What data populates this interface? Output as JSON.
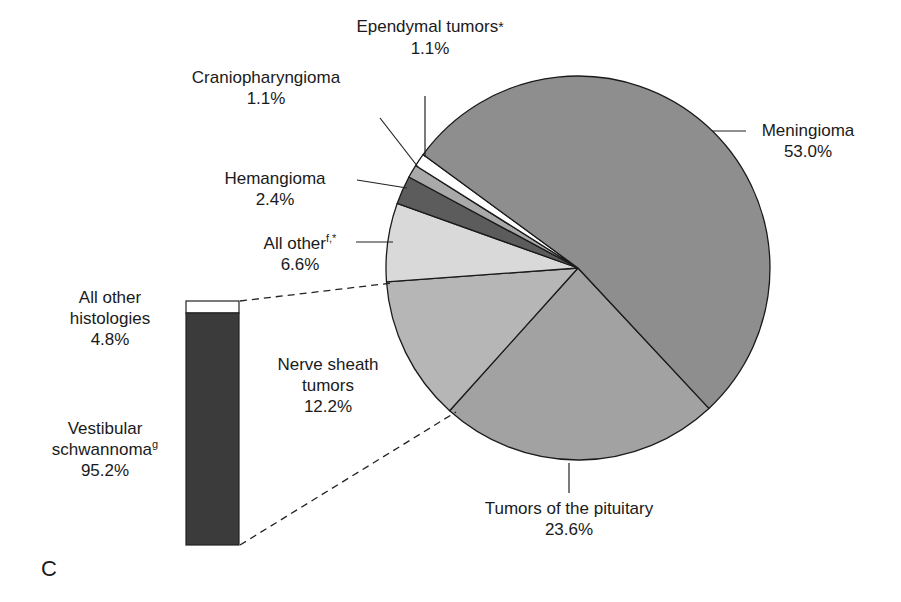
{
  "panel_label": "C",
  "chart_data": {
    "type": "pie",
    "title": "",
    "start_angle_deg": 47,
    "slices": [
      {
        "label": "Tumors of the pituitary",
        "sup": "",
        "value": 23.6,
        "value_text": "23.6%",
        "color": "#a2a2a2"
      },
      {
        "label": "Nerve sheath tumors",
        "sup": "",
        "value": 12.2,
        "value_text": "12.2%",
        "color": "#b6b6b6"
      },
      {
        "label": "All other",
        "sup": "f,*",
        "value": 6.6,
        "value_text": "6.6%",
        "color": "#d9d9d9"
      },
      {
        "label": "Hemangioma",
        "sup": "",
        "value": 2.4,
        "value_text": "2.4%",
        "color": "#5c5c5c"
      },
      {
        "label": "Craniopharyngioma",
        "sup": "",
        "value": 1.1,
        "value_text": "1.1%",
        "color": "#a9a9a9"
      },
      {
        "label": "Ependymal tumors",
        "sup": "*",
        "value": 1.1,
        "value_text": "1.1%",
        "color": "#ffffff"
      },
      {
        "label": "Meningioma",
        "sup": "",
        "value": 53.0,
        "value_text": "53.0%",
        "color": "#8e8e8e"
      }
    ],
    "breakdown_bar": {
      "of_slice": "Nerve sheath tumors",
      "segments": [
        {
          "label": "All other histologies",
          "sup": "",
          "value": 4.8,
          "value_text": "4.8%",
          "color": "#ffffff"
        },
        {
          "label": "Vestibular schwannoma",
          "sup": "g",
          "value": 95.2,
          "value_text": "95.2%",
          "color": "#3b3b3b"
        }
      ]
    }
  },
  "labels": {
    "ependymal": {
      "line1": "Ependymal tumors",
      "sup": "*",
      "line2": "1.1%"
    },
    "cranio": {
      "line1": "Craniopharyngioma",
      "line2": "1.1%"
    },
    "hemangioma": {
      "line1": "Hemangioma",
      "line2": "2.4%"
    },
    "allother": {
      "line1": "All other",
      "sup": "f,*",
      "line2": "6.6%"
    },
    "meningioma": {
      "line1": "Meningioma",
      "line2": "53.0%"
    },
    "nerve": {
      "line1": "Nerve sheath",
      "line2": "tumors",
      "line3": "12.2%"
    },
    "pituitary": {
      "line1": "Tumors of the pituitary",
      "line2": "23.6%"
    },
    "bar_other": {
      "line1": "All other",
      "line2": "histologies",
      "line3": "4.8%"
    },
    "bar_vs": {
      "line1": "Vestibular",
      "line2": "schwannoma",
      "sup": "g",
      "line3": "95.2%"
    }
  }
}
